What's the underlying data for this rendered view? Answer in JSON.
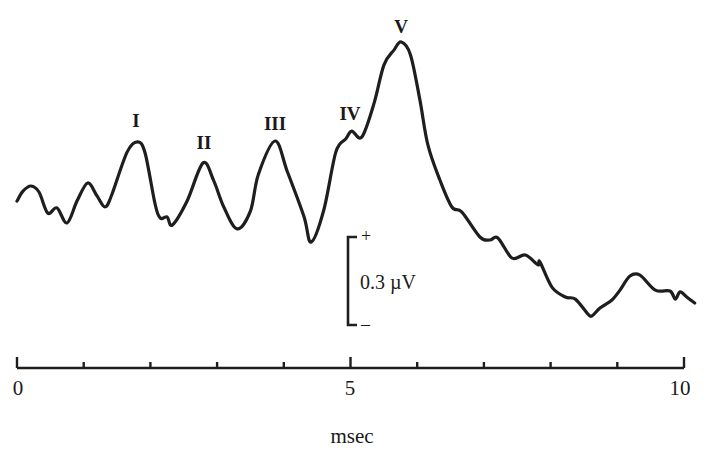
{
  "chart_data": {
    "type": "line",
    "title": "",
    "xlabel": "msec",
    "ylabel": "",
    "xlim": [
      0,
      10
    ],
    "x_ticks": [
      0,
      1,
      2,
      3,
      4,
      5,
      6,
      7,
      8,
      9,
      10
    ],
    "x_tick_labels": [
      {
        "value": 0,
        "label": "0"
      },
      {
        "value": 5,
        "label": "5"
      },
      {
        "value": 10,
        "label": "10"
      }
    ],
    "grid": false,
    "legend": null,
    "scale_bar": {
      "value": "0.3 µV",
      "amplitude_uV": 0.3,
      "plus_label": "+",
      "minus_label": "–"
    },
    "series": [
      {
        "name": "waveform",
        "unit_y": "µV (relative)",
        "points": [
          [
            0.0,
            0.0
          ],
          [
            0.09,
            0.033
          ],
          [
            0.21,
            0.05
          ],
          [
            0.33,
            0.03
          ],
          [
            0.46,
            -0.04
          ],
          [
            0.6,
            -0.023
          ],
          [
            0.75,
            -0.073
          ],
          [
            0.9,
            0.0
          ],
          [
            1.06,
            0.06
          ],
          [
            1.2,
            0.017
          ],
          [
            1.32,
            -0.02
          ],
          [
            1.42,
            0.02
          ],
          [
            1.65,
            0.163
          ],
          [
            1.81,
            0.197
          ],
          [
            1.92,
            0.16
          ],
          [
            2.07,
            -0.01
          ],
          [
            2.15,
            -0.057
          ],
          [
            2.25,
            -0.053
          ],
          [
            2.33,
            -0.08
          ],
          [
            2.55,
            0.0
          ],
          [
            2.79,
            0.127
          ],
          [
            2.95,
            0.067
          ],
          [
            3.1,
            -0.02
          ],
          [
            3.3,
            -0.093
          ],
          [
            3.5,
            -0.033
          ],
          [
            3.62,
            0.09
          ],
          [
            3.87,
            0.2
          ],
          [
            4.05,
            0.1
          ],
          [
            4.3,
            -0.05
          ],
          [
            4.41,
            -0.137
          ],
          [
            4.6,
            -0.03
          ],
          [
            4.78,
            0.163
          ],
          [
            4.93,
            0.207
          ],
          [
            5.02,
            0.233
          ],
          [
            5.17,
            0.213
          ],
          [
            5.35,
            0.323
          ],
          [
            5.5,
            0.453
          ],
          [
            5.65,
            0.503
          ],
          [
            5.76,
            0.53
          ],
          [
            5.9,
            0.487
          ],
          [
            6.04,
            0.337
          ],
          [
            6.16,
            0.187
          ],
          [
            6.34,
            0.07
          ],
          [
            6.52,
            -0.02
          ],
          [
            6.67,
            -0.037
          ],
          [
            6.94,
            -0.12
          ],
          [
            7.09,
            -0.13
          ],
          [
            7.21,
            -0.123
          ],
          [
            7.42,
            -0.19
          ],
          [
            7.62,
            -0.18
          ],
          [
            7.81,
            -0.213
          ],
          [
            7.84,
            -0.203
          ],
          [
            8.02,
            -0.287
          ],
          [
            8.22,
            -0.32
          ],
          [
            8.37,
            -0.327
          ],
          [
            8.56,
            -0.377
          ],
          [
            8.62,
            -0.383
          ],
          [
            8.74,
            -0.357
          ],
          [
            8.92,
            -0.33
          ],
          [
            9.04,
            -0.297
          ],
          [
            9.19,
            -0.25
          ],
          [
            9.34,
            -0.247
          ],
          [
            9.57,
            -0.297
          ],
          [
            9.79,
            -0.3
          ],
          [
            9.87,
            -0.327
          ],
          [
            9.94,
            -0.303
          ],
          [
            10.04,
            -0.32
          ],
          [
            10.16,
            -0.34
          ]
        ]
      }
    ],
    "peaks": [
      {
        "label": "I",
        "x": 1.81,
        "y": 0.197
      },
      {
        "label": "II",
        "x": 2.79,
        "y": 0.127
      },
      {
        "label": "III",
        "x": 3.87,
        "y": 0.2
      },
      {
        "label": "IV",
        "x": 5.02,
        "y": 0.233
      },
      {
        "label": "V",
        "x": 5.76,
        "y": 0.53
      }
    ]
  },
  "labels": {
    "peak_I": "I",
    "peak_II": "II",
    "peak_III": "III",
    "peak_IV": "IV",
    "peak_V": "V",
    "tick_0": "0",
    "tick_5": "5",
    "tick_10": "10",
    "x_axis": "msec",
    "scale_value": "0.3 µV",
    "scale_plus": "+",
    "scale_minus": "–"
  }
}
